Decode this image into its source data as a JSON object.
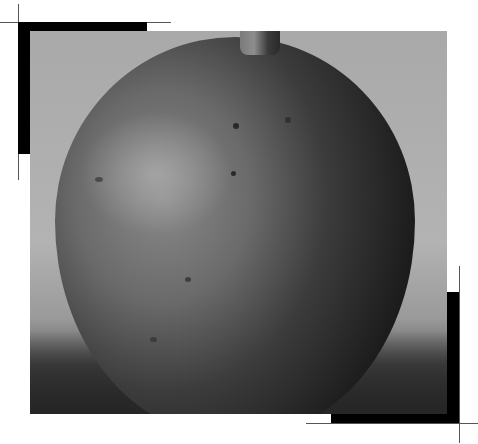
{
  "image": {
    "subject": "grayscale photograph of a round ceramic vase with a narrow neck",
    "style": "black-and-white photo with corner frame marks",
    "colors": {
      "background": "#ffffff",
      "frame_marks": "#000000",
      "crop_lines": "#555555",
      "backdrop": "#b0b0b0",
      "vase_dark": "#1c1c1c"
    }
  }
}
